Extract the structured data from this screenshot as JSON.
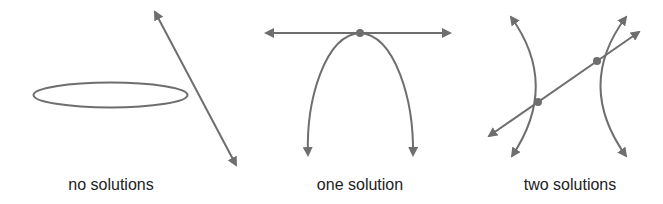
{
  "colors": {
    "stroke": "#6e6e6e",
    "text": "#222222",
    "background": "#ffffff"
  },
  "panels": [
    {
      "caption": "no solutions",
      "shapes": [
        "ellipse",
        "line"
      ],
      "intersections": 0
    },
    {
      "caption": "one solution",
      "shapes": [
        "parabola",
        "horizontal-line"
      ],
      "intersections": 1
    },
    {
      "caption": "two solutions",
      "shapes": [
        "hyperbola",
        "line"
      ],
      "intersections": 2
    }
  ]
}
